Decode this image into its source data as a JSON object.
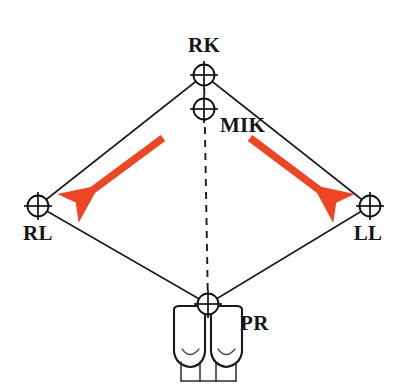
{
  "figure": {
    "kind": "dental-landmark-diagram",
    "background_color": "#ffffff",
    "width": 402,
    "height": 390,
    "line_color": "#1b1b1b",
    "arrow_color": "#EE4525",
    "label_color": "#161616"
  },
  "nodes": [
    {
      "id": "RK",
      "label": "RK",
      "x": 204,
      "y": 75,
      "radius": 10.5,
      "label_x": 204,
      "label_y": 52,
      "label_anchor": "middle"
    },
    {
      "id": "MIK",
      "label": "MIK",
      "x": 204,
      "y": 109,
      "radius": 10.5,
      "label_x": 220,
      "label_y": 132,
      "label_anchor": "start"
    },
    {
      "id": "RL",
      "label": "RL",
      "x": 38,
      "y": 206,
      "radius": 10.5,
      "label_x": 38,
      "label_y": 240,
      "label_anchor": "middle"
    },
    {
      "id": "LL",
      "label": "LL",
      "x": 370,
      "y": 206,
      "radius": 10.5,
      "label_x": 368,
      "label_y": 240,
      "label_anchor": "middle"
    },
    {
      "id": "PR",
      "label": "PR",
      "x": 208,
      "y": 304,
      "radius": 10.5,
      "label_x": 240,
      "label_y": 330,
      "label_anchor": "start"
    }
  ],
  "edges": [
    {
      "id": "rk-rl",
      "from": "RK",
      "to": "RL"
    },
    {
      "id": "rk-ll",
      "from": "RK",
      "to": "LL"
    },
    {
      "id": "rl-pr",
      "from": "RL",
      "to": "PR"
    },
    {
      "id": "ll-pr",
      "from": "LL",
      "to": "PR"
    }
  ],
  "midline": {
    "id": "rk-pr-midline",
    "style": "dashed",
    "from": "RK",
    "to": "PR"
  },
  "arrows": [
    {
      "id": "left-arrow",
      "direction": "down-left",
      "x1": 163,
      "y1": 138,
      "x2": 79,
      "y2": 200,
      "color": "#EE4525"
    },
    {
      "id": "right-arrow",
      "direction": "down-right",
      "x1": 250,
      "y1": 138,
      "x2": 333,
      "y2": 200,
      "color": "#EE4525"
    }
  ],
  "tooth_glyph": {
    "id": "incisor-pair",
    "description": "pair-of-central-incisors",
    "center_x": 208,
    "top_y": 304
  }
}
